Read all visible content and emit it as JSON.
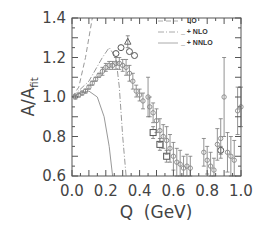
{
  "chart_data": {
    "type": "scatter",
    "title": "",
    "xlabel": "Q  (GeV)",
    "ylabel": "A/A",
    "ylabel_sub": "fit",
    "xlim": [
      0.0,
      1.0
    ],
    "ylim": [
      0.6,
      1.4
    ],
    "x_ticks": [
      "0.0",
      "0.2",
      "0.4",
      "0.6",
      "0.8",
      "1.0"
    ],
    "y_ticks": [
      "1.4",
      "1.2",
      "1.0",
      "0.8",
      "0.6"
    ],
    "grid": false,
    "legend_position": "upper right",
    "legend": [
      {
        "label": "LO",
        "style": "dashed"
      },
      {
        "label": "_ + NLO",
        "style": "dash-dot"
      },
      {
        "label": "_ + NNLO",
        "style": "solid"
      }
    ],
    "curves": [
      {
        "name": "LO",
        "style": "dashed",
        "points": [
          [
            0.0,
            1.0
          ],
          [
            0.04,
            1.05
          ],
          [
            0.08,
            1.2
          ],
          [
            0.12,
            1.4
          ]
        ]
      },
      {
        "name": "NLO",
        "style": "dash-dot",
        "points": [
          [
            0.0,
            1.0
          ],
          [
            0.1,
            1.08
          ],
          [
            0.18,
            1.2
          ],
          [
            0.22,
            1.25
          ],
          [
            0.26,
            1.2
          ],
          [
            0.28,
            1.05
          ],
          [
            0.3,
            0.8
          ],
          [
            0.32,
            0.6
          ]
        ]
      },
      {
        "name": "NNLO",
        "style": "solid",
        "points": [
          [
            0.0,
            1.0
          ],
          [
            0.05,
            1.02
          ],
          [
            0.1,
            1.03
          ],
          [
            0.15,
            1.0
          ],
          [
            0.19,
            0.9
          ],
          [
            0.22,
            0.75
          ],
          [
            0.24,
            0.6
          ]
        ]
      }
    ],
    "series": [
      {
        "name": "data-circles",
        "marker": "circle",
        "points": [
          [
            0.26,
            1.22,
            0
          ],
          [
            0.29,
            1.25,
            0
          ],
          [
            0.34,
            1.23,
            0
          ],
          [
            0.37,
            1.21,
            0
          ],
          [
            0.88,
            0.73,
            0.02
          ]
        ]
      },
      {
        "name": "data-squares",
        "marker": "square",
        "points": [
          [
            0.48,
            0.82,
            0.03
          ],
          [
            0.52,
            0.76,
            0.03
          ],
          [
            0.56,
            0.7,
            0.03
          ]
        ]
      },
      {
        "name": "data-triangles",
        "marker": "triangle",
        "points": [
          [
            0.33,
            1.28,
            0.03
          ]
        ]
      },
      {
        "name": "data-small",
        "marker": "diamond",
        "points": [
          [
            0.02,
            1.0,
            0.01
          ],
          [
            0.04,
            1.01,
            0.01
          ],
          [
            0.06,
            1.02,
            0.01
          ],
          [
            0.08,
            1.03,
            0.01
          ],
          [
            0.1,
            1.05,
            0.01
          ],
          [
            0.12,
            1.07,
            0.01
          ],
          [
            0.14,
            1.09,
            0.01
          ],
          [
            0.16,
            1.11,
            0.01
          ],
          [
            0.18,
            1.13,
            0.02
          ],
          [
            0.2,
            1.15,
            0.02
          ],
          [
            0.22,
            1.16,
            0.02
          ],
          [
            0.24,
            1.16,
            0.02
          ],
          [
            0.26,
            1.17,
            0.03
          ],
          [
            0.28,
            1.17,
            0.03
          ],
          [
            0.3,
            1.16,
            0.03
          ],
          [
            0.32,
            1.15,
            0.04
          ],
          [
            0.34,
            1.12,
            0.04
          ],
          [
            0.36,
            1.08,
            0.04
          ],
          [
            0.38,
            1.03,
            0.03
          ],
          [
            0.4,
            1.01,
            0.03
          ],
          [
            0.46,
            0.95,
            0.05
          ],
          [
            0.48,
            0.92,
            0.05
          ],
          [
            0.5,
            0.88,
            0.06
          ],
          [
            0.52,
            0.83,
            0.06
          ],
          [
            0.54,
            0.8,
            0.06
          ],
          [
            0.56,
            0.78,
            0.07
          ],
          [
            0.58,
            0.74,
            0.07
          ],
          [
            0.6,
            0.7,
            0.07
          ],
          [
            0.62,
            0.67,
            0.07
          ],
          [
            0.64,
            0.66,
            0.07
          ],
          [
            0.66,
            0.64,
            0.06
          ],
          [
            0.68,
            0.65,
            0.06
          ],
          [
            0.7,
            0.64,
            0.06
          ],
          [
            0.78,
            0.72,
            0.07
          ],
          [
            0.8,
            0.68,
            0.07
          ],
          [
            0.82,
            0.65,
            0.07
          ],
          [
            0.84,
            0.63,
            0.06
          ],
          [
            0.86,
            0.76,
            0.08
          ],
          [
            0.88,
            0.79,
            0.1
          ],
          [
            0.9,
            1.0,
            0.2
          ],
          [
            0.92,
            0.72,
            0.1
          ],
          [
            0.94,
            0.7,
            0.1
          ],
          [
            0.96,
            0.68,
            0.1
          ],
          [
            0.98,
            0.93,
            0.12
          ],
          [
            1.0,
            0.95,
            0.1
          ],
          [
            0.45,
            1.0,
            0.1
          ],
          [
            0.42,
            0.98,
            0.04
          ]
        ]
      }
    ]
  },
  "axes": {
    "xlabel": "Q  (GeV)",
    "ylabel_main": "A/A",
    "ylabel_sub": "fit"
  }
}
